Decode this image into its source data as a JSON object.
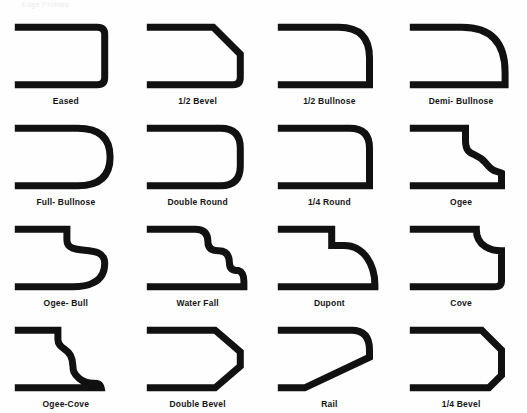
{
  "page": {
    "top_cut_text": "Edge Profiles",
    "background_color": "#fefefe",
    "stroke_color": "#111111",
    "label_color": "#141414",
    "columns": 4,
    "rows": 4,
    "total_profiles": 16
  },
  "chart_data": {
    "type": "table",
    "categories": [
      "Eased",
      "1/2 Bevel",
      "1/2 Bullnose",
      "Demi- Bullnose",
      "Full- Bullnose",
      "Double Round",
      "1/4 Round",
      "Ogee",
      "Ogee- Bull",
      "Water Fall",
      "Dupont",
      "Cove",
      "Ogee-Cove",
      "Double Bevel",
      "Rail",
      "1/4 Bevel"
    ],
    "values": [
      1,
      2,
      3,
      4,
      5,
      6,
      7,
      8,
      9,
      10,
      11,
      12,
      13,
      14,
      15,
      16
    ],
    "xlabel": "",
    "ylabel": "",
    "legend": []
  },
  "profiles": [
    {
      "index": 1,
      "label": "Eased",
      "description": "square edge with slightly eased corners",
      "path": "M8 8 L96 8 Q104 8 104 16 L104 64 Q104 72 96 72 L8 72"
    },
    {
      "index": 2,
      "label": "1/2 Bevel",
      "description": "upper chamfer cut at 45 degrees",
      "path": "M8 8 L78 8 L108 38 L108 64 Q108 72 100 72 L8 72"
    },
    {
      "index": 3,
      "label": "1/2 Bullnose",
      "description": "large radius on the top corner only",
      "path": "M8 8 L72 8 Q106 8 106 42 L106 72 L8 72"
    },
    {
      "index": 4,
      "label": "Demi- Bullnose",
      "description": "deep half round on top, short straight face below",
      "path": "M8 8 L62 8 Q110 8 110 58 L110 72 L8 72"
    },
    {
      "index": 5,
      "label": "Full- Bullnose",
      "description": "complete semicircular nose",
      "path": "M8 8 L74 8 Q110 8 110 40 Q110 72 74 72 L8 72"
    },
    {
      "index": 6,
      "label": "Double Round",
      "description": "matching radius on top and bottom with flat face",
      "path": "M8 8 L86 8 Q108 8 108 30 L108 50 Q108 72 86 72 L8 72"
    },
    {
      "index": 7,
      "label": "1/4 Round",
      "description": "small quarter round at the top corner",
      "path": "M8 8 L84 8 Q106 8 106 30 L106 72 L8 72"
    },
    {
      "index": 8,
      "label": "Ogee",
      "description": "S shaped curve below a small top step",
      "path": "M8 8 L66 8 L66 22 C66 40 78 34 88 46 C98 58 98 54 106 58 L106 72 L8 72"
    },
    {
      "index": 9,
      "label": "Ogee- Bull",
      "description": "ogee step flowing into a rounded bullnose bottom",
      "path": "M8 8 L62 8 L62 20 C62 40 104 22 104 46 C104 68 84 72 68 72 L8 72"
    },
    {
      "index": 10,
      "label": "Water Fall",
      "description": "three descending stepped round-overs",
      "path": "M8 8 L58 8 Q72 8 72 22 Q72 32 84 32 Q96 32 96 46 Q96 54 106 54 Q112 56 112 66 L112 72 L8 72"
    },
    {
      "index": 11,
      "label": "Dupont",
      "description": "square step then a long sweeping convex curve",
      "path": "M8 8 L64 8 L64 26 L78 26 C100 26 112 48 112 70 L112 72 L8 72"
    },
    {
      "index": 12,
      "label": "Cove",
      "description": "concave cove below a top step, flat vertical face",
      "path": "M8 8 L78 8 C78 28 96 32 106 32 L106 66 Q106 72 98 72 L8 72"
    },
    {
      "index": 13,
      "label": "Ogee-Cove",
      "description": "stacked double S curve ending in a small foot",
      "path": "M8 8 L52 8 L52 18 C52 28 62 28 66 36 C72 48 64 52 76 62 C88 72 98 62 100 72 L8 72"
    },
    {
      "index": 14,
      "label": "Double Bevel",
      "description": "symmetric chamfers top and bottom",
      "path": "M8 8 L80 8 L108 32 L108 48 L80 72 L8 72"
    },
    {
      "index": 15,
      "label": "Rail",
      "description": "rounded top corner with a long diagonal undercut",
      "path": "M8 8 L86 8 Q106 8 106 30 L106 38 L34 72 L8 72"
    },
    {
      "index": 16,
      "label": "1/4 Bevel",
      "description": "short chamfer on the top corner only",
      "path": "M8 8 L84 8 L106 30 L106 58 L92 72 L8 72"
    }
  ]
}
